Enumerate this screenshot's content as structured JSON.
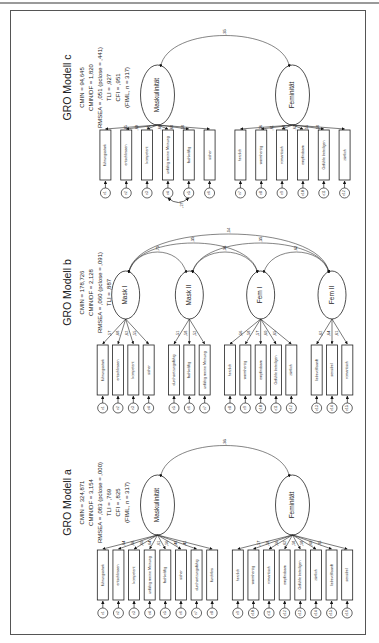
{
  "page": {
    "orientation": "rotated-90"
  },
  "models": [
    {
      "title": "GRO Modell c",
      "fit": [
        "CMIN = 94,645",
        "CMIN/DF = 1,820",
        "RMSEA = ,051 (pclose = ,441)",
        "TLI = ,927",
        "CFI = ,951",
        "(FIML, n = 317)"
      ],
      "factors": [
        {
          "name": "Maskulinität",
          "items": [
            "führungsstark",
            "entschlossen",
            "kompetent",
            "unfähig meine Meinung",
            "fachkräftig",
            "sicher"
          ],
          "loadings": [
            ",65",
            ",69",
            ",71",
            ",66",
            ",68",
            ",58"
          ],
          "errors": [
            "e1",
            "e2",
            "e3",
            "e4",
            "e5",
            "e6"
          ]
        },
        {
          "name": "Feminität",
          "items": [
            "herzlich",
            "warmherzig",
            "romantisch",
            "empfindsam",
            "Gefühle beteiligen",
            "zärtlich"
          ],
          "loadings": [
            ",56",
            ",61",
            ",58",
            ",62",
            ",55",
            ",58"
          ],
          "errors": [
            "e7",
            "e8",
            "e9",
            "e10",
            "e11",
            "e12"
          ]
        }
      ],
      "correlations": [
        {
          "from": "Maskulinität",
          "to": "Feminität",
          "value": ",35"
        }
      ],
      "error_covariances": [
        {
          "from": "e4",
          "to": "e5",
          "value": ",27"
        }
      ]
    },
    {
      "title": "GRO Modell b",
      "fit": [
        "CMIN = 178,726",
        "CMIN/DF = 2,128",
        "RMSEA = ,060 (pclose = ,091)",
        "TLI = ,887",
        "CFI = ,921",
        "(FIML, n = 317)"
      ],
      "factors": [
        {
          "name": "Mask I",
          "items": [
            "führungsstark",
            "entschlossen",
            "kompetent",
            "sicher"
          ],
          "loadings": [
            ",57",
            ",68",
            ",62",
            ",55"
          ],
          "errors": [
            "e1",
            "e2",
            "e3",
            "e4"
          ]
        },
        {
          "name": "Mask II",
          "items": [
            "durchsetzungsfähig",
            "fachkräftig",
            "unfähig meine Meinung"
          ],
          "loadings": [
            ",51",
            ",58",
            ",52"
          ],
          "errors": [
            "e5",
            "e6",
            "e7"
          ]
        },
        {
          "name": "Fem I",
          "items": [
            "herzlich",
            "warmherzig",
            "empfindsam",
            "Gefühle beteiligen",
            "zärtlich"
          ],
          "loadings": [
            ",56",
            ",58",
            ",57",
            ",60",
            ",65"
          ],
          "errors": [
            "e8",
            "e9",
            "e10",
            "e11",
            "e12"
          ]
        },
        {
          "name": "Fem II",
          "items": [
            "liebevoll/sanft",
            "sensibel",
            "romantisch"
          ],
          "loadings": [
            ",62",
            ",64",
            ",61"
          ],
          "errors": [
            "e13",
            "e14",
            "e15"
          ]
        }
      ],
      "correlations": [
        {
          "from": "Mask I",
          "to": "Mask II",
          "value": ",75"
        },
        {
          "from": "Mask I",
          "to": "Fem I",
          "value": ",35"
        },
        {
          "from": "Mask I",
          "to": "Fem II",
          "value": ",14"
        },
        {
          "from": "Mask II",
          "to": "Fem I",
          "value": ",36"
        },
        {
          "from": "Mask II",
          "to": "Fem II",
          "value": ",35"
        },
        {
          "from": "Fem I",
          "to": "Fem II",
          "value": ",62"
        }
      ],
      "error_covariances": []
    },
    {
      "title": "GRO Modell a",
      "fit": [
        "CMIN = 324,871",
        "CMIN/DF = 3,154",
        "RMSEA = ,083 (pclose = ,000)",
        "TLI = ,769",
        "CFI = ,825",
        "(FIML, n = 317)"
      ],
      "factors": [
        {
          "name": "Maskulinität",
          "items": [
            "führungsstark",
            "entschlossen",
            "kompetent",
            "unfähig meine Meinung",
            "fachkräftig",
            "sicher",
            "durchsetzungsfähig",
            "furchtlos"
          ],
          "loadings": [
            ",64",
            ",66",
            ",60",
            ",64",
            ",61",
            ",56",
            ",48",
            ",41"
          ],
          "errors": [
            "e1",
            "e2",
            "e3",
            "e4",
            "e5",
            "e6",
            "e7",
            "e8"
          ]
        },
        {
          "name": "Feminität",
          "items": [
            "herzlich",
            "warmherzig",
            "romantisch",
            "empfindsam",
            "Gefühle beteiligen",
            "zärtlich",
            "liebevoll/sanft",
            "sensibel"
          ],
          "loadings": [
            ",57",
            ",58",
            ",56",
            ",62",
            ",58",
            ",58",
            ",60",
            ",35"
          ],
          "errors": [
            "e9",
            "e10",
            "e11",
            "e12",
            "e13",
            "e14",
            "e15",
            "e16"
          ]
        }
      ],
      "correlations": [
        {
          "from": "Maskulinität",
          "to": "Feminität",
          "value": ",36"
        }
      ],
      "error_covariances": []
    }
  ]
}
